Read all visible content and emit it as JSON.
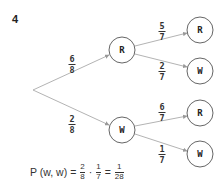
{
  "question_number": "4",
  "tree": {
    "root": {
      "x": 33,
      "y": 90
    },
    "first_level": [
      {
        "label": "R",
        "x": 122,
        "y": 50,
        "edge_prob": {
          "num": "6",
          "den": "8"
        },
        "label_pos": {
          "x": 72,
          "y": 55
        }
      },
      {
        "label": "W",
        "x": 122,
        "y": 130,
        "edge_prob": {
          "num": "2",
          "den": "8"
        },
        "label_pos": {
          "x": 72,
          "y": 115
        }
      }
    ],
    "second_level": [
      {
        "parent": "R",
        "label": "R",
        "x": 200,
        "y": 30,
        "edge_prob": {
          "num": "5",
          "den": "7"
        },
        "label_pos": {
          "x": 162,
          "y": 22
        }
      },
      {
        "parent": "R",
        "label": "W",
        "x": 200,
        "y": 71,
        "edge_prob": {
          "num": "2",
          "den": "7"
        },
        "label_pos": {
          "x": 162,
          "y": 62
        }
      },
      {
        "parent": "W",
        "label": "R",
        "x": 200,
        "y": 113,
        "edge_prob": {
          "num": "6",
          "den": "7"
        },
        "label_pos": {
          "x": 162,
          "y": 103
        }
      },
      {
        "parent": "W",
        "label": "W",
        "x": 200,
        "y": 154,
        "edge_prob": {
          "num": "1",
          "den": "7"
        },
        "label_pos": {
          "x": 162,
          "y": 145
        }
      }
    ],
    "node_radius": 13,
    "line_color": "#aaaaaa",
    "node_stroke": "#555555"
  },
  "formula": {
    "lhs": "P (w, w)",
    "eq": "=",
    "frac1": {
      "num": "2",
      "den": "8"
    },
    "dot": "·",
    "frac2": {
      "num": "1",
      "den": "7"
    },
    "eq2": "=",
    "result": {
      "num": "1",
      "den": "28"
    }
  }
}
